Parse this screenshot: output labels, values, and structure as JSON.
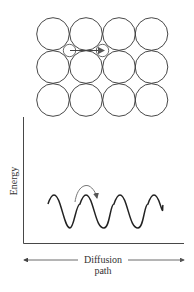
{
  "diagram": {
    "type": "diffusion-energy-diagram",
    "lattice": {
      "rows": 3,
      "cols": 4,
      "description": "Square array of host atoms with interstitial atom hopping between interstitial sites",
      "interstitial_arrow": "right"
    },
    "energy_plot": {
      "ylabel": "Energy",
      "xlabel_line1": "Diffusion",
      "xlabel_line2": "path",
      "curve": "periodic energy barriers (sinusoidal)",
      "hop_arrow": "curved arrow over barrier"
    },
    "colors": {
      "stroke": "#333333",
      "arrow": "#777777",
      "background": "#ffffff"
    }
  }
}
